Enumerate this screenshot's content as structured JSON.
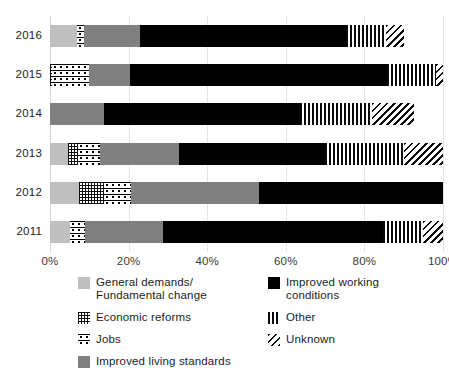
{
  "chart_data": {
    "type": "bar",
    "orientation": "horizontal",
    "stacked": true,
    "normalized": true,
    "title": "",
    "xlabel": "",
    "ylabel": "",
    "xlim": [
      0,
      100
    ],
    "xticks": [
      "0%",
      "20%",
      "40%",
      "60%",
      "80%",
      "100%"
    ],
    "xtick_values": [
      0,
      20,
      40,
      60,
      80,
      100
    ],
    "grid": "vertical",
    "legend_position": "bottom",
    "categories": [
      "2016",
      "2015",
      "2014",
      "2013",
      "2012",
      "2011"
    ],
    "series": [
      {
        "name": "General demands/\nFundamental change",
        "key": "general",
        "fill": "light-gray-solid",
        "values": [
          6.9,
          0.0,
          0.0,
          4.6,
          7.4,
          5.1
        ]
      },
      {
        "name": "Economic reforms",
        "key": "econ",
        "fill": "fine-grid-hatch",
        "values": [
          0.0,
          0.5,
          0.0,
          2.5,
          6.4,
          0.0
        ]
      },
      {
        "name": "Jobs",
        "key": "jobs",
        "fill": "dotted-star-hatch",
        "values": [
          1.8,
          9.4,
          0.0,
          5.6,
          6.9,
          3.8
        ]
      },
      {
        "name": "Improved living standards",
        "key": "living",
        "fill": "mid-gray-solid",
        "values": [
          14.2,
          10.4,
          13.7,
          20.1,
          32.6,
          19.8
        ]
      },
      {
        "name": "Improved working\nconditions",
        "key": "working",
        "fill": "black-solid",
        "values": [
          52.4,
          65.4,
          49.9,
          37.2,
          46.8,
          56.0
        ]
      },
      {
        "name": "Other",
        "key": "other",
        "fill": "vertical-stripes",
        "values": [
          10.2,
          12.5,
          18.3,
          20.1,
          0.0,
          10.2
        ]
      },
      {
        "name": "Unknown",
        "key": "unknown",
        "fill": "diagonal-stripes",
        "values": [
          4.6,
          1.8,
          10.7,
          9.9,
          0.0,
          5.1
        ]
      }
    ]
  },
  "axis": {
    "ytick_labels": [
      "2016",
      "2015",
      "2014",
      "2013",
      "2012",
      "2011"
    ],
    "xtick_labels": [
      "0%",
      "20%",
      "40%",
      "60%",
      "80%",
      "100%"
    ]
  },
  "legend": {
    "left_items": [
      {
        "label": "General demands/\nFundamental change",
        "fill": "general"
      },
      {
        "label": "Economic reforms",
        "fill": "econ"
      },
      {
        "label": "Jobs",
        "fill": "jobs"
      },
      {
        "label": "Improved living standards",
        "fill": "living"
      }
    ],
    "right_items": [
      {
        "label": "Improved working\nconditions",
        "fill": "working"
      },
      {
        "label": "Other",
        "fill": "other"
      },
      {
        "label": "Unknown",
        "fill": "unknown"
      }
    ]
  },
  "colors": {
    "general": "#bfbfbf",
    "living": "#808080",
    "working": "#000000",
    "pattern_ink": "#0a0a0a",
    "grid": "#e4e4e4",
    "text": "#1c1c1c"
  }
}
